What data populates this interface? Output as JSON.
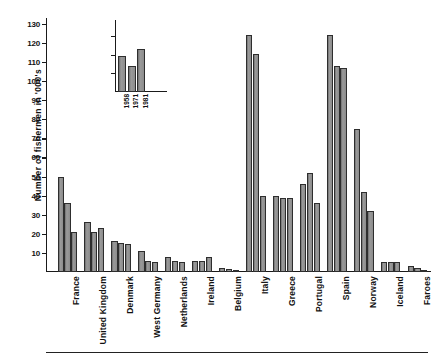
{
  "chart_data": {
    "type": "bar",
    "title": "",
    "xlabel": "",
    "ylabel": "Number of fishermen in '000's",
    "ylim": [
      0,
      133
    ],
    "grid": false,
    "legend_position": "inset-top-left",
    "yticks": [
      10,
      20,
      30,
      40,
      50,
      60,
      70,
      80,
      90,
      100,
      110,
      120,
      130
    ],
    "ytick_labels": [
      "10",
      "20",
      "30",
      "40",
      "50",
      "60",
      "70",
      "80",
      "90",
      "100",
      "110",
      "120",
      "130"
    ],
    "categories": [
      "France",
      "United Kingdom",
      "Denmark",
      "West Germany",
      "Netherlands",
      "Ireland",
      "Belgium",
      "Italy",
      "Greece",
      "Portugal",
      "Spain",
      "Norway",
      "Iceland",
      "Faroes"
    ],
    "series": [
      {
        "name": "1958",
        "values": [
          50,
          26,
          16,
          11,
          8,
          6,
          2,
          124,
          40,
          46,
          124,
          75,
          5,
          3
        ]
      },
      {
        "name": "1971",
        "values": [
          36,
          21,
          15,
          6,
          6,
          6,
          1.5,
          114,
          39,
          52,
          108,
          42,
          5,
          2
        ]
      },
      {
        "name": "1981",
        "values": [
          21,
          23,
          14.5,
          5,
          5.5,
          8,
          1,
          40,
          39,
          36,
          107,
          32,
          5,
          1
        ]
      }
    ],
    "legend_entries": [
      "1958",
      "1971",
      "1981"
    ],
    "legend_inset": {
      "values": [
        109.5,
        104.5,
        113.5
      ],
      "years": [
        "1958",
        "1971",
        "1981"
      ],
      "axis_top": 124,
      "axis_bottom": 90,
      "ticks": [
        100,
        110,
        120
      ]
    },
    "colors": {
      "bar_fill": "#8a8a8a",
      "bar_edge": "#2e2e2e",
      "axis": "#1a1a1a",
      "text": "#111111",
      "background": "#ffffff"
    }
  }
}
